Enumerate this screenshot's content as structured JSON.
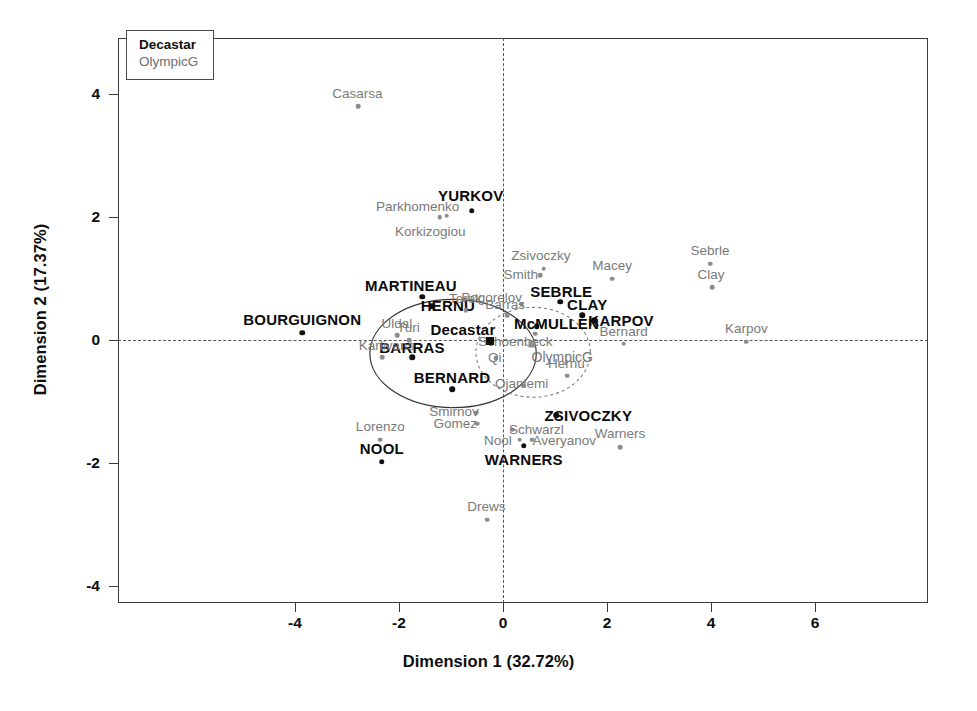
{
  "chart_data": {
    "type": "scatter",
    "title": "",
    "xlabel": "Dimension 1 (32.72%)",
    "ylabel": "Dimension 2 (17.37%)",
    "xlim": [
      -5.4,
      7.1
    ],
    "ylim": [
      -4.6,
      4.8
    ],
    "xticks": [
      -4,
      -2,
      0,
      2,
      4,
      6
    ],
    "yticks": [
      -4,
      -2,
      0,
      2,
      4
    ],
    "xticklabels": [
      "-4",
      "-2",
      "0",
      "2",
      "4",
      "6"
    ],
    "yticklabels": [
      "-4",
      "-2",
      "0",
      "2",
      "4"
    ],
    "grid": false,
    "reference_lines": {
      "horizontal": 0,
      "vertical": 0,
      "style": "dashed"
    },
    "legend": {
      "position": "top-left-inside",
      "entries": [
        {
          "label": "Decastar",
          "style": "bold-dark"
        },
        {
          "label": "OlympicG",
          "style": "light-gray"
        }
      ]
    },
    "series": [
      {
        "name": "Decastar",
        "style": "bold-dark",
        "points": [
          {
            "label": "YURKOV",
            "x": -0.6,
            "y": 2.1,
            "label_dx": -0.02,
            "label_dy": 0.26
          },
          {
            "label": "MARTINEAU",
            "x": -1.55,
            "y": 0.7,
            "label_dx": -0.22,
            "label_dy": 0.2
          },
          {
            "label": "HERNU",
            "x": -1.36,
            "y": 0.55,
            "label_dx": 0.3,
            "label_dy": 0.02
          },
          {
            "label": "BOURGUIGNON",
            "x": -3.86,
            "y": 0.12,
            "label_dx": 0.0,
            "label_dy": 0.22
          },
          {
            "label": "SEBRLE",
            "x": 1.1,
            "y": 0.62,
            "label_dx": 0.02,
            "label_dy": 0.18
          },
          {
            "label": "CLAY",
            "x": 1.52,
            "y": 0.4,
            "label_dx": 0.1,
            "label_dy": 0.18
          },
          {
            "label": "KARPOV",
            "x": 1.75,
            "y": 0.32,
            "label_dx": 0.52,
            "label_dy": 0.0
          },
          {
            "label": "McMULLEN",
            "x": 0.65,
            "y": 0.22,
            "label_dx": 0.38,
            "label_dy": 0.06
          },
          {
            "label": "BARRAS",
            "x": -1.75,
            "y": -0.28,
            "label_dx": 0.0,
            "label_dy": 0.17
          },
          {
            "label": "BERNARD",
            "x": -0.98,
            "y": -0.8,
            "label_dx": 0.0,
            "label_dy": 0.2
          },
          {
            "label": "ZSIVOCZKY",
            "x": 1.02,
            "y": -1.22,
            "label_dx": 0.62,
            "label_dy": 0.0
          },
          {
            "label": "WARNERS",
            "x": 0.4,
            "y": -1.72,
            "label_dx": 0.0,
            "label_dy": -0.22
          },
          {
            "label": "NOOL",
            "x": -2.33,
            "y": -1.98,
            "label_dx": 0.0,
            "label_dy": 0.22
          }
        ]
      },
      {
        "name": "OlympicG",
        "style": "light-gray",
        "points": [
          {
            "label": "Casarsa",
            "x": -2.78,
            "y": 3.8,
            "label_dx": -0.02,
            "label_dy": 0.22
          },
          {
            "label": "Parkhomenko",
            "x": -1.08,
            "y": 2.02,
            "label_dx": -0.56,
            "label_dy": 0.16
          },
          {
            "label": "Korkizogiou",
            "x": -1.22,
            "y": 2.0,
            "label_dx": -0.18,
            "label_dy": -0.22
          },
          {
            "label": "Zsivoczky",
            "x": 0.78,
            "y": 1.16,
            "label_dx": -0.05,
            "label_dy": 0.22
          },
          {
            "label": "Smith",
            "x": 0.72,
            "y": 1.05,
            "label_dx": -0.38,
            "label_dy": 0.02
          },
          {
            "label": "Macey",
            "x": 2.1,
            "y": 1.0,
            "label_dx": 0.0,
            "label_dy": 0.22
          },
          {
            "label": "Sebrle",
            "x": 3.98,
            "y": 1.24,
            "label_dx": 0.0,
            "label_dy": 0.22
          },
          {
            "label": "Clay",
            "x": 4.02,
            "y": 0.86,
            "label_dx": -0.02,
            "label_dy": 0.22
          },
          {
            "label": "Pogorelov",
            "x": 0.36,
            "y": 0.58,
            "label_dx": -0.58,
            "label_dy": 0.12
          },
          {
            "label": "Terek",
            "x": -0.72,
            "y": 0.48,
            "label_dx": 0.0,
            "label_dy": 0.2
          },
          {
            "label": "Barras",
            "x": 0.08,
            "y": 0.4,
            "label_dx": -0.04,
            "label_dy": 0.18
          },
          {
            "label": "Uldal",
            "x": -2.04,
            "y": 0.08,
            "label_dx": 0.0,
            "label_dy": 0.2
          },
          {
            "label": "Turi",
            "x": -1.8,
            "y": 0.0,
            "label_dx": -0.02,
            "label_dy": 0.21
          },
          {
            "label": "Schoenbeck",
            "x": 0.62,
            "y": 0.1,
            "label_dx": -0.38,
            "label_dy": -0.12
          },
          {
            "label": "Bernard",
            "x": 2.32,
            "y": -0.06,
            "label_dx": 0.0,
            "label_dy": 0.21
          },
          {
            "label": "Karpov",
            "x": 4.68,
            "y": -0.03,
            "label_dx": 0.0,
            "label_dy": 0.22
          },
          {
            "label": "Karlivans",
            "x": -2.32,
            "y": -0.28,
            "label_dx": 0.08,
            "label_dy": 0.2
          },
          {
            "label": "Qi",
            "x": -0.14,
            "y": -0.3,
            "label_dx": -0.02,
            "label_dy": 0.02
          },
          {
            "label": "Hernu",
            "x": 1.24,
            "y": -0.58,
            "label_dx": -0.02,
            "label_dy": 0.2
          },
          {
            "label": "Ojaniemi",
            "x": 0.4,
            "y": -0.74,
            "label_dx": -0.04,
            "label_dy": 0.04
          },
          {
            "label": "Smirnov",
            "x": -0.52,
            "y": -1.18,
            "label_dx": -0.42,
            "label_dy": 0.02
          },
          {
            "label": "Gomez",
            "x": -0.5,
            "y": -1.36,
            "label_dx": -0.42,
            "label_dy": 0.01
          },
          {
            "label": "Lorenzo",
            "x": -2.36,
            "y": -1.62,
            "label_dx": 0.0,
            "label_dy": 0.22
          },
          {
            "label": "Schwarzl",
            "x": 0.18,
            "y": -1.46,
            "label_dx": 0.46,
            "label_dy": 0.01
          },
          {
            "label": "Nool",
            "x": 0.32,
            "y": -1.62,
            "label_dx": -0.42,
            "label_dy": 0.0
          },
          {
            "label": "Averyanov",
            "x": 0.56,
            "y": -1.62,
            "label_dx": 0.62,
            "label_dy": 0.0
          },
          {
            "label": "Warners",
            "x": 2.25,
            "y": -1.74,
            "label_dx": 0.0,
            "label_dy": 0.22
          },
          {
            "label": "Drews",
            "x": -0.3,
            "y": -2.92,
            "label_dx": -0.02,
            "label_dy": 0.22
          }
        ]
      }
    ],
    "centroids": [
      {
        "label": "Decastar",
        "x": -0.25,
        "y": -0.02,
        "style": "bold-dark",
        "label_dx": -0.52,
        "label_dy": 0.2
      },
      {
        "label": "OlympicG",
        "x": 0.56,
        "y": -0.06,
        "style": "light-gray",
        "label_dx": 0.58,
        "label_dy": -0.22
      }
    ],
    "confidence_ellipses": [
      {
        "group": "Decastar",
        "cx": -0.96,
        "cy": -0.22,
        "rx": 1.6,
        "ry": 0.88,
        "rotation": 0,
        "line": "solid"
      },
      {
        "group": "OlympicG",
        "cx": 0.58,
        "cy": -0.2,
        "rx": 1.1,
        "ry": 0.73,
        "rotation": 0,
        "line": "dotted"
      }
    ]
  },
  "axes": {
    "x_title": "Dimension 1 (32.72%)",
    "y_title": "Dimension 2 (17.37%)"
  },
  "legend": {
    "decastar": "Decastar",
    "olympicg": "OlympicG"
  }
}
